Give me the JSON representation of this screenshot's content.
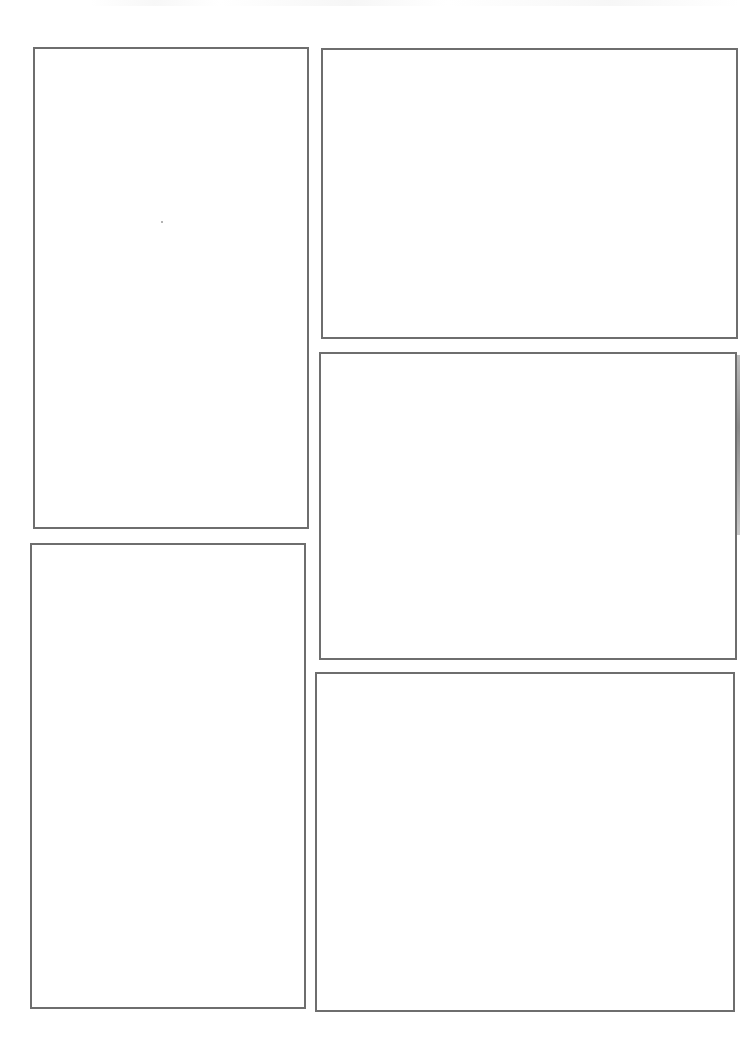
{
  "page": {
    "type": "blank comic page template",
    "border_color": "#6e6e6e",
    "background": "#ffffff"
  },
  "panels": [
    {
      "id": "panel-1",
      "position": "left-top",
      "x": 33,
      "y": 47,
      "w": 276,
      "h": 482
    },
    {
      "id": "panel-2",
      "position": "left-bottom",
      "x": 30,
      "y": 543,
      "w": 276,
      "h": 466
    },
    {
      "id": "panel-3",
      "position": "right-top",
      "x": 321,
      "y": 48,
      "w": 417,
      "h": 291
    },
    {
      "id": "panel-4",
      "position": "right-middle",
      "x": 319,
      "y": 352,
      "w": 418,
      "h": 308
    },
    {
      "id": "panel-5",
      "position": "right-bottom",
      "x": 315,
      "y": 672,
      "w": 420,
      "h": 340
    }
  ]
}
